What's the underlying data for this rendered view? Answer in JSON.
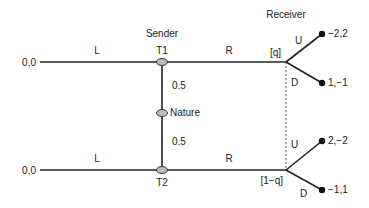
{
  "players": {
    "sender": "Sender",
    "receiver": "Receiver",
    "nature": "Nature"
  },
  "nodes": {
    "t1": "T1",
    "t2": "T2"
  },
  "actions": {
    "sender_top_left": "L",
    "sender_top_right": "R",
    "sender_bottom_left": "L",
    "sender_bottom_right": "R",
    "receiver_top_up": "U",
    "receiver_top_down": "D",
    "receiver_bottom_up": "U",
    "receiver_bottom_down": "D"
  },
  "probabilities": {
    "nature_to_t1": "0.5",
    "nature_to_t2": "0.5"
  },
  "beliefs": {
    "top": "[q]",
    "bottom": "[1−q]"
  },
  "payoffs": {
    "top_left": "0,0",
    "bottom_left": "0,0",
    "top_up": "−2,2",
    "top_down": "1,−1",
    "bottom_up": "2,−2",
    "bottom_down": "−1,1"
  }
}
